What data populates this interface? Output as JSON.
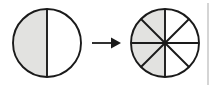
{
  "figure": {
    "background_color": "#ffffff",
    "stroke_color": "#1a1a1a",
    "shaded_fill_color": "#e2e2e0",
    "empty_fill_color": "#ffffff",
    "edge_rule_color": "#b9b9b9",
    "width": 214,
    "height": 88
  },
  "left_circle": {
    "name": "one-half-circle",
    "center_x": 47,
    "center_y": 43,
    "radius": 34,
    "total_parts": 2,
    "shaded_parts": 1,
    "fraction_label": "1/2",
    "divider_count": 1,
    "divider_orientation": "vertical",
    "sectors": [
      {
        "index": 0,
        "start_angle": 90,
        "end_angle": 270,
        "shaded": true,
        "side": "left"
      },
      {
        "index": 1,
        "start_angle": 270,
        "end_angle": 450,
        "shaded": false,
        "side": "right"
      }
    ]
  },
  "arrow": {
    "name": "transformation-arrow",
    "direction": "right",
    "shaft_start_x": 92,
    "shaft_end_x": 112,
    "tip_x": 121,
    "y": 43,
    "label": ""
  },
  "right_circle": {
    "name": "four-eighths-circle",
    "center_x": 165,
    "center_y": 43,
    "radius": 34,
    "total_parts": 8,
    "shaded_parts": 4,
    "fraction_label": "4/8",
    "divider_count": 4,
    "divider_orientations": [
      "vertical",
      "horizontal",
      "diagonal-45",
      "diagonal-135"
    ],
    "sector_angle_degrees": 45,
    "sectors": [
      {
        "index": 0,
        "start_angle": 90,
        "end_angle": 135,
        "shaded": true,
        "side": "left"
      },
      {
        "index": 1,
        "start_angle": 135,
        "end_angle": 180,
        "shaded": true,
        "side": "left"
      },
      {
        "index": 2,
        "start_angle": 180,
        "end_angle": 225,
        "shaded": true,
        "side": "left"
      },
      {
        "index": 3,
        "start_angle": 225,
        "end_angle": 270,
        "shaded": true,
        "side": "left"
      },
      {
        "index": 4,
        "start_angle": 270,
        "end_angle": 315,
        "shaded": false,
        "side": "right"
      },
      {
        "index": 5,
        "start_angle": 315,
        "end_angle": 360,
        "shaded": false,
        "side": "right"
      },
      {
        "index": 6,
        "start_angle": 0,
        "end_angle": 45,
        "shaded": false,
        "side": "right"
      },
      {
        "index": 7,
        "start_angle": 45,
        "end_angle": 90,
        "shaded": false,
        "side": "right"
      }
    ]
  },
  "edge_rule": {
    "name": "page-edge-rule",
    "x": 208,
    "y_top": 3,
    "y_bottom": 85
  }
}
